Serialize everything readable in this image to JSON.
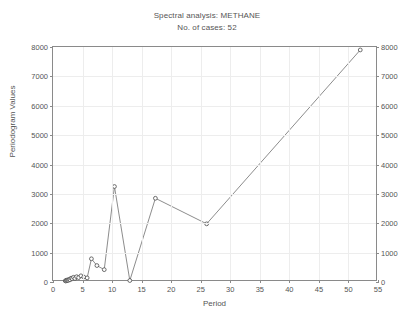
{
  "chart_data": {
    "type": "line",
    "title": "Spectral analysis: METHANE",
    "subtitle": "No. of cases: 52",
    "xlabel": "Period",
    "ylabel": "Periodogram Values",
    "xlim": [
      0,
      55
    ],
    "ylim": [
      0,
      8000
    ],
    "xticks": [
      0,
      5,
      10,
      15,
      20,
      25,
      30,
      35,
      40,
      45,
      50,
      55
    ],
    "yticks": [
      0,
      1000,
      2000,
      3000,
      4000,
      5000,
      6000,
      7000,
      8000
    ],
    "grid": true,
    "legend": "none",
    "right_axis_mirrored": true,
    "marker": "open-circle",
    "line_color": "#6e6e6e",
    "marker_color": "#4a4a4a",
    "grid_color": "#ededed",
    "axis_color": "#8a8a8a",
    "x": [
      2.08,
      2.17,
      2.26,
      2.36,
      2.48,
      2.6,
      2.74,
      2.89,
      3.06,
      3.25,
      3.47,
      3.71,
      4.0,
      4.33,
      4.73,
      5.2,
      5.78,
      6.5,
      7.43,
      8.67,
      10.4,
      13.0,
      17.33,
      26.0,
      52.0
    ],
    "values": [
      40,
      35,
      60,
      45,
      70,
      55,
      90,
      75,
      130,
      110,
      160,
      120,
      180,
      150,
      210,
      170,
      140,
      790,
      560,
      420,
      3250,
      50,
      2850,
      1980,
      7900
    ],
    "annotations": []
  },
  "axis": {
    "x_tick_labels": [
      "0",
      "5",
      "10",
      "15",
      "20",
      "25",
      "30",
      "35",
      "40",
      "45",
      "50",
      "55"
    ],
    "y_tick_labels": [
      "0",
      "1000",
      "2000",
      "3000",
      "4000",
      "5000",
      "6000",
      "7000",
      "8000"
    ]
  }
}
